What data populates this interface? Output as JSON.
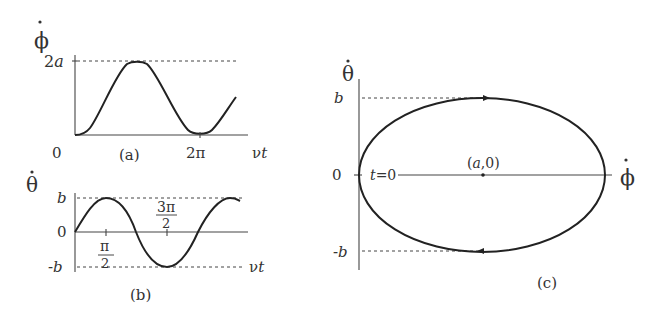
{
  "panels": {
    "a": {
      "caption": "(a)",
      "y_label": "φ̇",
      "x_label": "νt",
      "y_ticks": [
        "2a",
        "0"
      ],
      "x_ticks": [
        "2π"
      ]
    },
    "b": {
      "caption": "(b)",
      "y_label": "θ̇",
      "x_label": "νt",
      "y_ticks": [
        "b",
        "0",
        "-b"
      ],
      "x_ticks": [
        {
          "num": "π",
          "den": "2"
        },
        {
          "num": "3π",
          "den": "2"
        }
      ]
    },
    "c": {
      "caption": "(c)",
      "y_label": "θ̇",
      "x_label": "φ̇",
      "y_ticks": [
        "b",
        "0",
        "-b"
      ],
      "start_label": "t=0",
      "center_label": "(a,0)"
    }
  },
  "colors": {
    "line": "#222222",
    "axis": "#444444",
    "text": "#333333"
  }
}
